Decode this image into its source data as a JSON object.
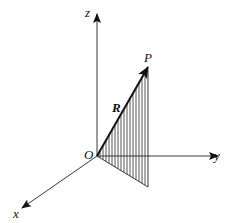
{
  "diagram": {
    "type": "3d-coordinate-axes",
    "labels": {
      "z_axis": "z",
      "y_axis": "y",
      "x_axis": "x",
      "origin": "O",
      "point": "P",
      "vector": "R"
    },
    "colors": {
      "line": "#222222",
      "hatch": "#444444",
      "background": "#ffffff"
    },
    "geometry": {
      "origin": [
        97,
        156
      ],
      "z_tip": [
        97,
        14
      ],
      "y_tip": [
        218,
        156
      ],
      "x_tip": [
        22,
        208
      ],
      "p_tip": [
        148,
        67
      ],
      "foot": [
        148,
        187
      ]
    }
  }
}
